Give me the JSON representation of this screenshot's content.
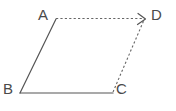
{
  "figure": {
    "shape_type": "parallelogram",
    "stroke_color": "#555555",
    "label_color": "#4a4a4a",
    "background_color": "#ffffff",
    "vertices": [
      {
        "name": "A",
        "label": "A",
        "x": 56,
        "y": 19,
        "label_x": 38,
        "label_y": 7
      },
      {
        "name": "B",
        "label": "B",
        "x": 20,
        "y": 93,
        "label_x": 3,
        "label_y": 81
      },
      {
        "name": "C",
        "label": "C",
        "x": 113,
        "y": 93,
        "label_x": 116,
        "label_y": 81
      },
      {
        "name": "D",
        "label": "D",
        "x": 145,
        "y": 19,
        "label_x": 151,
        "label_y": 7
      }
    ],
    "edges": [
      {
        "name": "edge-AB",
        "from": "A",
        "to": "B",
        "style": "solid",
        "arrow": false
      },
      {
        "name": "edge-BC",
        "from": "B",
        "to": "C",
        "style": "solid",
        "arrow": false
      },
      {
        "name": "edge-AD",
        "from": "A",
        "to": "D",
        "style": "dashed",
        "arrow": true
      },
      {
        "name": "edge-CD",
        "from": "C",
        "to": "D",
        "style": "dashed",
        "arrow": true
      }
    ]
  }
}
